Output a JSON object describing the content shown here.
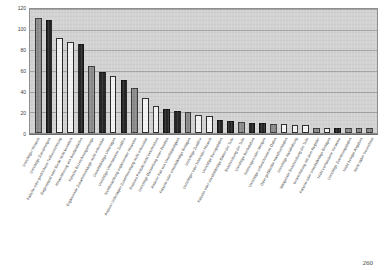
{
  "page": {
    "number": "260"
  },
  "chart_data": {
    "type": "bar",
    "title": "",
    "subtitle": "",
    "xlabel": "",
    "ylabel": "",
    "ylim": [
      0,
      120
    ],
    "yticks": [
      0,
      20,
      40,
      60,
      80,
      100,
      120
    ],
    "ytick_labels": [
      "0",
      "20",
      "40",
      "60",
      "80",
      "100",
      "120"
    ],
    "grid": true,
    "legend": "none",
    "sorted": "descending",
    "categories": [
      "Unrichtiger Hinweis",
      "Unrichtige Zuordnungen",
      "Falsche oder gestrichene Teilbezeichnung",
      "Gegenstand oder Gerät nicht kenntlich",
      "Hinweisbezug von Bestandteilen",
      "Falsche Bezeichnungsmenge",
      "Ergänzende Zusammenhänge nicht erkennbar",
      "Unvollständige Unterlagen",
      "Unrichtige Unterlassene Zusätze",
      "Nichtbeachtung ergänzender Hinweise",
      "Anderer Unterlagen Zusammenhang nicht erkennbar",
      "Anderes Produkt nicht beschrieben",
      "Unrichtige Darstellung einer Position",
      "Anderer Fall von Unvollständigkeit",
      "Falsche oder unvollständige Beilagen",
      "Unrichtige Zusätze",
      "Unrichtiger oder fehlender Hinweis",
      "Unrichtige Bezugsdaten",
      "Falsche oder unvollständige Daten der Teile",
      "Beschreibung der Teile",
      "Unrichtige Buchstaben",
      "Teilmengen oder Mengen",
      "Unrichtige unbeschriebene Daten",
      "Oder gefälschte Handbuchdaten",
      "Unrichtige Handhabung",
      "Mangelnde Beschreibung der Teile",
      "Verwechslung mit dem Register",
      "Falsche oder unvollständige Beilagen",
      "Nicht vorhandene Verweise",
      "Unrichtige Zuordnungsdaten",
      "Nicht belegte Angaben",
      "Nicht näher bezeichnet"
    ],
    "values": [
      111,
      109,
      92,
      88,
      86,
      65,
      59,
      55,
      51,
      44,
      34,
      26,
      23,
      21,
      20,
      17,
      16,
      13,
      12,
      11,
      10,
      10,
      9,
      9,
      8,
      8,
      5,
      5,
      5,
      5,
      5,
      5
    ],
    "bar_colors": [
      "mid",
      "dark",
      "light",
      "light",
      "dark",
      "mid",
      "dark",
      "light",
      "dark",
      "mid",
      "light",
      "light",
      "dark",
      "dark",
      "mid",
      "light",
      "light",
      "dark",
      "dark",
      "mid",
      "dark",
      "dark",
      "mid",
      "light",
      "light",
      "light",
      "mid",
      "light",
      "dark",
      "mid",
      "mid",
      "mid"
    ],
    "palette": {
      "dark": "#262626",
      "mid": "#8a8a8a",
      "light": "#f2f2f2",
      "plot_background": "#d2d2d2",
      "gridline": "#9a9a9a",
      "axis": "#6d6d6d"
    }
  }
}
